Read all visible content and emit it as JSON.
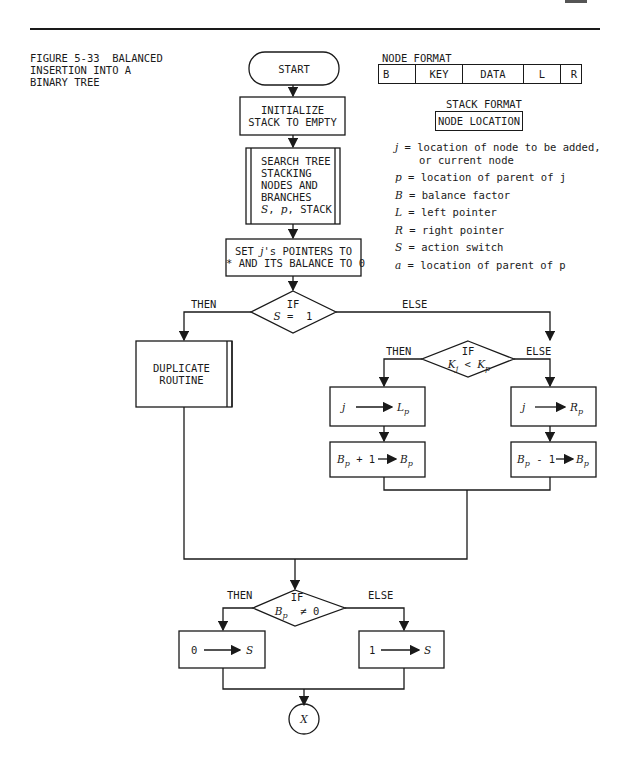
{
  "page": {
    "figure_caption": [
      "FIGURE 5-33  BALANCED",
      "INSERTION INTO A",
      "BINARY TREE"
    ]
  },
  "node_format": {
    "title": "NODE FORMAT",
    "fields": [
      "B",
      "KEY",
      "DATA",
      "L",
      "R"
    ]
  },
  "stack_format": {
    "title": "STACK FORMAT",
    "field": "NODE LOCATION"
  },
  "legend": [
    {
      "symbol": "j",
      "text": "location of node to be added,",
      "cont": "or current node"
    },
    {
      "symbol": "p",
      "text": "location of parent of j"
    },
    {
      "symbol": "B",
      "text": "balance factor"
    },
    {
      "symbol": "L",
      "text": "left pointer"
    },
    {
      "symbol": "R",
      "text": "right pointer"
    },
    {
      "symbol": "S",
      "text": "action switch"
    },
    {
      "symbol": "a",
      "text": "location of parent of p"
    }
  ],
  "flowchart": {
    "start": "START",
    "init": [
      "INITIALIZE",
      "STACK TO EMPTY"
    ],
    "search": [
      "SEARCH TREE",
      "STACKING",
      "NODES AND",
      "BRANCHES",
      "S, p, STACK"
    ],
    "set_pointers": [
      "SET j's POINTERS TO",
      "* AND ITS BALANCE TO 0"
    ],
    "decision1": {
      "if": "IF",
      "cond": "S = 1",
      "then": "THEN",
      "else": "ELSE"
    },
    "duplicate": [
      "DUPLICATE",
      "ROUTINE"
    ],
    "decision2": {
      "if": "IF",
      "cond": "Kj < Kp",
      "then": "THEN",
      "else": "ELSE"
    },
    "assign_left": {
      "from": "j",
      "to": "Lp"
    },
    "assign_right": {
      "from": "j",
      "to": "Rp"
    },
    "inc_balance": {
      "from": "Bp + 1",
      "to": "Bp"
    },
    "dec_balance": {
      "from": "Bp - 1",
      "to": "Bp"
    },
    "decision3": {
      "if": "IF",
      "cond": "Bp ≠ 0",
      "then": "THEN",
      "else": "ELSE"
    },
    "set_s0": {
      "from": "0",
      "to": "S"
    },
    "set_s1": {
      "from": "1",
      "to": "S"
    },
    "connector": "X"
  }
}
